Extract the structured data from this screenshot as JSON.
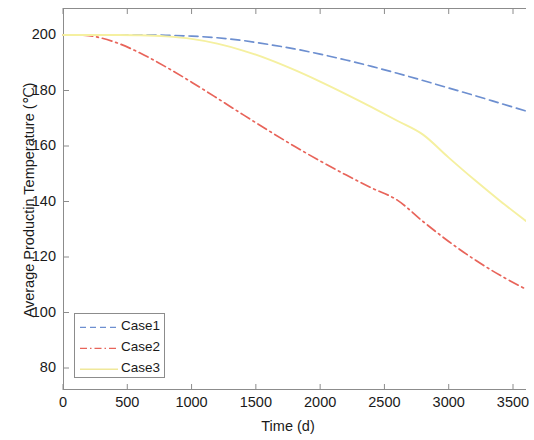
{
  "chart_data": {
    "type": "line",
    "title": "",
    "xlabel": "Time (d)",
    "ylabel": "Average Productin Temperature (℃)",
    "xlim": [
      0,
      3950
    ],
    "ylim": [
      73,
      205
    ],
    "xticks": [
      0,
      500,
      1000,
      1500,
      2000,
      2500,
      3000,
      3500
    ],
    "xtick_labels": [
      "0",
      "500",
      "1000",
      "1500",
      "2000",
      "2500",
      "3000",
      "3500"
    ],
    "yticks": [
      80,
      100,
      120,
      140,
      160,
      180,
      200
    ],
    "ytick_labels": [
      "80",
      "100",
      "120",
      "140",
      "160",
      "180",
      "200"
    ],
    "grid": false,
    "legend_position": "lower-left",
    "note": "plot area extends past right edge of image (cropped)",
    "series": [
      {
        "name": "Case1",
        "color": "#6d8fd0",
        "style": "dashed",
        "x": [
          0,
          200,
          400,
          600,
          800,
          1000,
          1200,
          1400,
          1600,
          1800,
          2000,
          2200,
          2400,
          2600,
          2800,
          3000,
          3200,
          3400,
          3600
        ],
        "values": [
          200.0,
          200.0,
          200.0,
          200.0,
          199.9,
          199.6,
          199.0,
          198.0,
          196.6,
          195.0,
          193.1,
          191.0,
          188.7,
          186.2,
          183.6,
          180.9,
          178.2,
          175.4,
          172.6
        ]
      },
      {
        "name": "Case2",
        "color": "#e8645a",
        "style": "dash-dot",
        "x": [
          0,
          200,
          400,
          600,
          800,
          1000,
          1200,
          1400,
          1600,
          1800,
          2000,
          2200,
          2400,
          2600,
          2800,
          3000,
          3200,
          3400,
          3600
        ],
        "values": [
          200.0,
          199.8,
          197.5,
          193.5,
          188.5,
          183.0,
          177.2,
          171.3,
          165.5,
          159.9,
          154.6,
          149.6,
          144.9,
          140.5,
          132.8,
          125.6,
          119.1,
          113.4,
          108.4
        ]
      },
      {
        "name": "Case3",
        "color": "#f5f0a0",
        "style": "solid",
        "x": [
          0,
          200,
          400,
          600,
          800,
          1000,
          1200,
          1400,
          1600,
          1800,
          2000,
          2200,
          2400,
          2600,
          2800,
          3000,
          3200,
          3400,
          3600
        ],
        "values": [
          200.0,
          200.0,
          200.0,
          199.9,
          199.5,
          198.6,
          196.9,
          194.4,
          191.2,
          187.4,
          183.2,
          178.7,
          174.0,
          169.1,
          164.1,
          155.8,
          147.8,
          140.2,
          133.0
        ]
      }
    ]
  },
  "legend": {
    "items": [
      {
        "label": "Case1"
      },
      {
        "label": "Case2"
      },
      {
        "label": "Case3"
      }
    ]
  },
  "axes": {
    "x_label": "Time (d)",
    "y_label": "Average Productin Temperature (℃)"
  }
}
